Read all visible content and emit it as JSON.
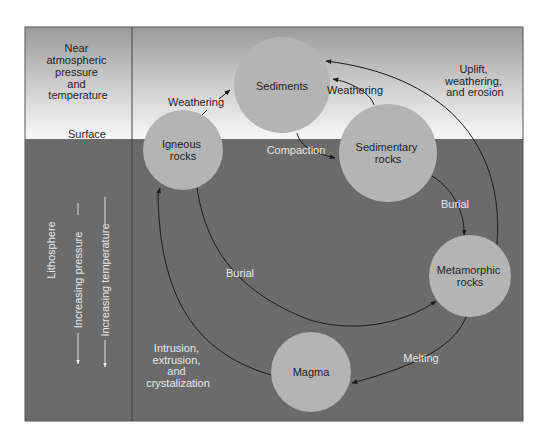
{
  "left_panel": {
    "top_label_lines": [
      "Near",
      "atmospheric",
      "pressure",
      "and",
      "temperature"
    ],
    "surface_label": "Surface",
    "lithosphere_label": "Lithosphere",
    "pressure_label": "Increasing pressure",
    "temperature_label": "Increasing temperature"
  },
  "nodes": {
    "sediments": {
      "label_lines": [
        "Sediments"
      ]
    },
    "igneous": {
      "label_lines": [
        "Igneous",
        "rocks"
      ]
    },
    "sedimentary": {
      "label_lines": [
        "Sedimentary",
        "rocks"
      ]
    },
    "metamorphic": {
      "label_lines": [
        "Metamorphic",
        "rocks"
      ]
    },
    "magma": {
      "label_lines": [
        "Magma"
      ]
    }
  },
  "edges": {
    "weathering_igneous": "Weathering",
    "weathering_sedimentary": "Weathering",
    "compaction": "Compaction",
    "burial_sedimentary": "Burial",
    "burial_igneous": "Burial",
    "melting": "Melting",
    "uplift_lines": [
      "Uplift,",
      "weathering,",
      "and erosion"
    ],
    "intrusion_lines": [
      "Intrusion,",
      "extrusion,",
      "and",
      "crystalization"
    ]
  },
  "colors": {
    "node_fill": "#b4b4b4",
    "subsurface": "#6b6b6b",
    "sky_top": "#9a9a9a",
    "sky_bottom": "#f6f6f6",
    "line": "#1a1a1a"
  }
}
